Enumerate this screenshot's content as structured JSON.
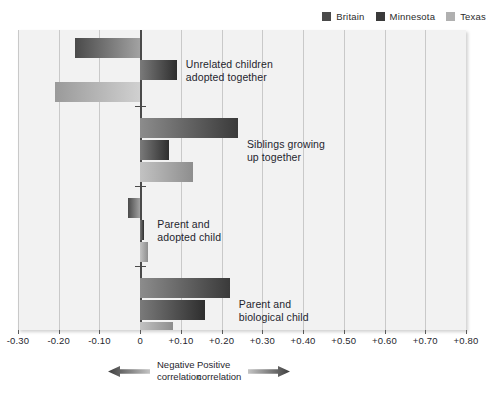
{
  "legend": {
    "entries": [
      {
        "label": "Britain",
        "color": "#4a4a4a"
      },
      {
        "label": "Minnesota",
        "color": "#3a3a3a"
      },
      {
        "label": "Texas",
        "color": "#b0b0b0"
      }
    ]
  },
  "axis": {
    "ticks": [
      "-0.30",
      "-0.20",
      "-0.10",
      "0",
      "+0.10",
      "+0.20",
      "+0.30",
      "+0.40",
      "+0.50",
      "+0.60",
      "+0.70",
      "+0.80"
    ],
    "tick_values": [
      -0.3,
      -0.2,
      -0.1,
      0,
      0.1,
      0.2,
      0.3,
      0.4,
      0.5,
      0.6,
      0.7,
      0.8
    ]
  },
  "captions": {
    "negative_line1": "Negative",
    "negative_line2": "correlation",
    "positive_line1": "Positive",
    "positive_line2": "correlation"
  },
  "categories": [
    {
      "label_line1": "Unrelated children",
      "label_line2": "adopted together"
    },
    {
      "label_line1": "Siblings growing",
      "label_line2": "up together"
    },
    {
      "label_line1": "Parent and",
      "label_line2": "adopted child"
    },
    {
      "label_line1": "Parent and",
      "label_line2": "biological child"
    }
  ],
  "chart_data": {
    "type": "bar",
    "orientation": "horizontal",
    "title": "",
    "xlabel": "Correlation",
    "ylabel": "",
    "xlim": [
      -0.3,
      0.8
    ],
    "grid": true,
    "legend_position": "top-right",
    "categories": [
      "Unrelated children adopted together",
      "Siblings growing up together",
      "Parent and adopted child",
      "Parent and biological child"
    ],
    "series": [
      {
        "name": "Britain",
        "values": [
          -0.16,
          0.24,
          -0.03,
          0.22
        ]
      },
      {
        "name": "Minnesota",
        "values": [
          0.09,
          0.07,
          0.01,
          0.16
        ]
      },
      {
        "name": "Texas",
        "values": [
          -0.21,
          0.13,
          0.02,
          0.08
        ]
      }
    ]
  }
}
